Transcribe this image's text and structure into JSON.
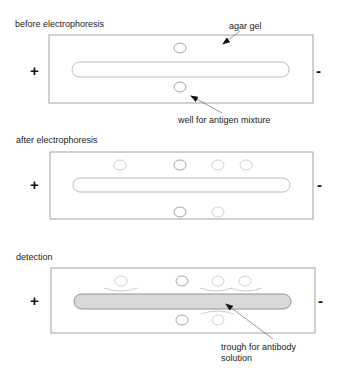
{
  "panels": [
    {
      "id": "before",
      "title": "before electrophoresis",
      "plus": "+",
      "minus": "-",
      "annotations": {
        "agar_gel": "agar gel",
        "well": "well for antigen mixture"
      }
    },
    {
      "id": "after",
      "title": "after electrophoresis",
      "plus": "+",
      "minus": "-"
    },
    {
      "id": "detection",
      "title": "detection",
      "plus": "+",
      "minus": "-",
      "annotations": {
        "trough_line1": "trough for antibody",
        "trough_line2": "solution"
      }
    }
  ],
  "colors": {
    "gel_border": "#8a8a8a",
    "trough_fill": "#d9d9d9",
    "precipitin_arc": "#c8c8c8",
    "text": "#222222"
  }
}
